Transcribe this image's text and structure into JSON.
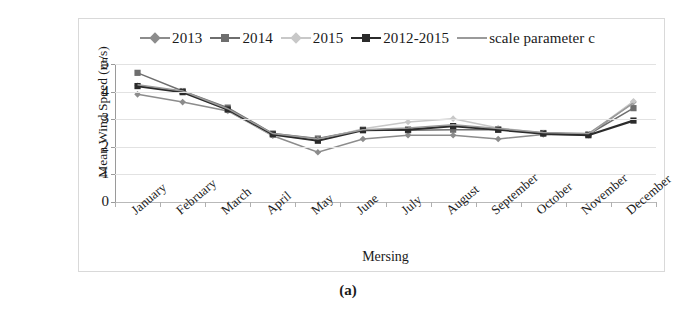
{
  "figure": {
    "caption": "(a)",
    "border_color": "#d9d9d9"
  },
  "chart_data": {
    "type": "line",
    "title": "",
    "xlabel": "Mersing",
    "ylabel": "Mean Wind Speed (m/s)",
    "categories": [
      "January",
      "February",
      "March",
      "April",
      "May",
      "June",
      "July",
      "August",
      "September",
      "October",
      "November",
      "December"
    ],
    "ylim": [
      0,
      5
    ],
    "yticks": [
      0,
      1,
      2,
      3,
      4,
      5
    ],
    "grid": true,
    "legend_position": "top",
    "series": [
      {
        "name": "2013",
        "color": "#8c8c8c",
        "marker": "diamond",
        "values": [
          3.9,
          3.62,
          3.3,
          2.4,
          1.8,
          2.28,
          2.42,
          2.42,
          2.28,
          2.45,
          2.42,
          3.62
        ]
      },
      {
        "name": "2014",
        "color": "#6e6e6e",
        "marker": "square",
        "values": [
          4.68,
          4.02,
          3.42,
          2.48,
          2.3,
          2.62,
          2.6,
          2.62,
          2.62,
          2.5,
          2.45,
          3.4
        ]
      },
      {
        "name": "2015",
        "color": "#c8c8c8",
        "marker": "diamond",
        "values": [
          4.22,
          4.0,
          3.32,
          2.42,
          2.25,
          2.65,
          2.9,
          3.02,
          2.68,
          2.5,
          2.45,
          3.65
        ]
      },
      {
        "name": "2012-2015",
        "color": "#2b2b2b",
        "marker": "square",
        "values": [
          4.2,
          3.98,
          3.35,
          2.45,
          2.22,
          2.6,
          2.62,
          2.75,
          2.62,
          2.48,
          2.42,
          2.95
        ]
      },
      {
        "name": "scale parameter c",
        "color": "#9a9a9a",
        "marker": "none",
        "values": [
          4.25,
          4.02,
          3.38,
          2.48,
          2.28,
          2.62,
          2.68,
          2.8,
          2.66,
          2.52,
          2.48,
          3.58
        ]
      }
    ]
  }
}
